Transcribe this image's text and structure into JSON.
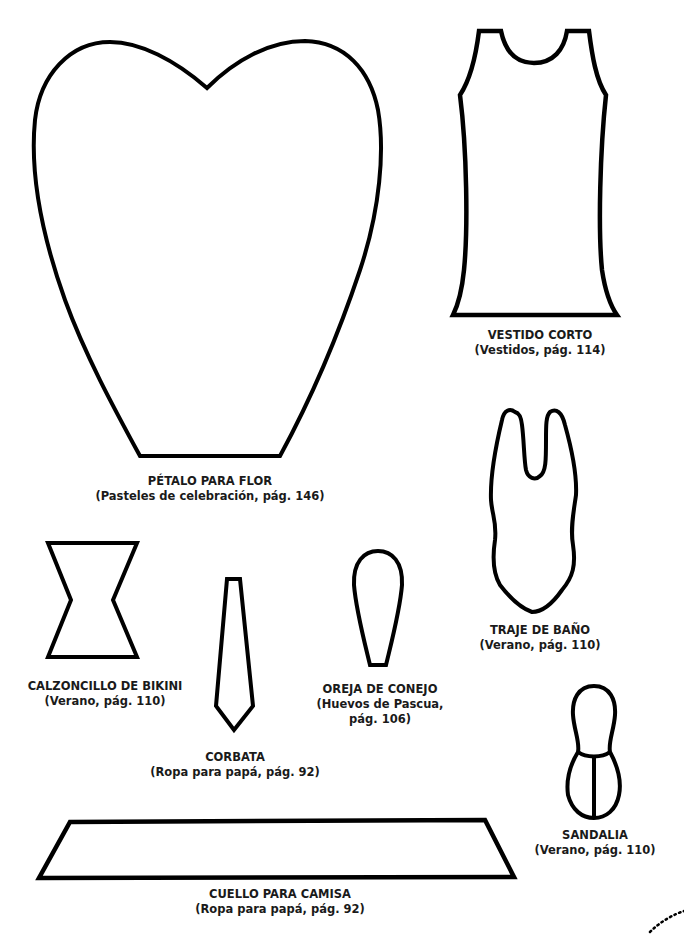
{
  "templates": [
    {
      "id": "petalo",
      "title": "PÉTALO PARA FLOR",
      "subtitle": "(Pasteles de celebración, pág. 146)"
    },
    {
      "id": "vestido",
      "title": "VESTIDO CORTO",
      "subtitle": "(Vestidos, pág. 114)"
    },
    {
      "id": "traje",
      "title": "TRAJE DE BAÑO",
      "subtitle": "(Verano, pág. 110)"
    },
    {
      "id": "calzoncillo",
      "title": "CALZONCILLO DE BIKINI",
      "subtitle": "(Verano, pág. 110)"
    },
    {
      "id": "corbata",
      "title": "CORBATA",
      "subtitle": "(Ropa para papá, pág. 92)"
    },
    {
      "id": "oreja",
      "title": "OREJA DE CONEJO",
      "subtitle": "(Huevos de Pascua,",
      "subtitle2": "pág. 106)"
    },
    {
      "id": "sandalia",
      "title": "SANDALIA",
      "subtitle": "(Verano, pág. 110)"
    },
    {
      "id": "cuello",
      "title": "CUELLO PARA CAMISA",
      "subtitle": "(Ropa para papá, pág. 92)"
    }
  ],
  "colors": {
    "stroke": "#000000",
    "background": "#ffffff",
    "text": "#1a1a1a"
  }
}
